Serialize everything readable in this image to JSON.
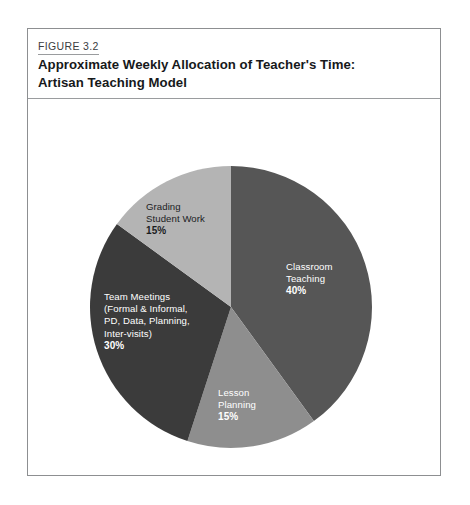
{
  "figure": {
    "number": "FIGURE 3.2",
    "title_line1": "Approximate Weekly Allocation of Teacher's Time:",
    "title_line2": "Artisan Teaching Model"
  },
  "chart_data": {
    "type": "pie",
    "title": "Approximate Weekly Allocation of Teacher's Time: Artisan Teaching Model",
    "start_angle_deg": 0,
    "direction": "clockwise",
    "total": 100,
    "unit": "%",
    "legend": "none (labels placed inside slices)",
    "categories": [
      "Classroom Teaching",
      "Lesson Planning",
      "Team Meetings (Formal & Informal, PD, Data, Planning, Inter-visits)",
      "Grading Student Work"
    ],
    "values": [
      40,
      15,
      30,
      15
    ],
    "colors": [
      "#565656",
      "#8e8e8e",
      "#3b3b3b",
      "#b4b4b4"
    ],
    "slices": [
      {
        "name": "Classroom Teaching",
        "value": 40,
        "percent_label": "40%",
        "color": "#565656",
        "label_lines": [
          "Classroom",
          "Teaching"
        ],
        "label_color": "#ffffff",
        "start_deg": 0,
        "end_deg": 144
      },
      {
        "name": "Lesson Planning",
        "value": 15,
        "percent_label": "15%",
        "color": "#8e8e8e",
        "label_lines": [
          "Lesson",
          "Planning"
        ],
        "label_color": "#ffffff",
        "start_deg": 144,
        "end_deg": 198
      },
      {
        "name": "Team Meetings",
        "value": 30,
        "percent_label": "30%",
        "color": "#3b3b3b",
        "label_lines": [
          "Team Meetings",
          "(Formal & Informal,",
          "PD, Data, Planning,",
          "Inter-visits)"
        ],
        "label_color": "#ffffff",
        "start_deg": 198,
        "end_deg": 306
      },
      {
        "name": "Grading Student Work",
        "value": 15,
        "percent_label": "15%",
        "color": "#b4b4b4",
        "label_lines": [
          "Grading",
          "Student Work"
        ],
        "label_color": "#1b1d1f",
        "start_deg": 306,
        "end_deg": 360
      }
    ]
  }
}
